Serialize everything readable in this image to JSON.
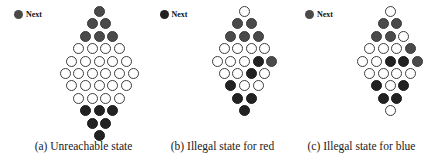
{
  "figure": {
    "background_color": "#ffffff",
    "colors": {
      "red_piece": "#4a4a4a",
      "blue_piece": "#222222",
      "empty_cell": "#ffffff",
      "cell_outline": "#3d3d3d",
      "text": "#1a1a1a"
    }
  },
  "panels": [
    {
      "id": "panel-a",
      "caption": "(a) Unreachable state",
      "legend": {
        "label": "Next",
        "player": "red",
        "color": "#4a4a4a"
      },
      "board": {
        "row_sizes": [
          1,
          2,
          3,
          4,
          5,
          6,
          5,
          4,
          3,
          2,
          1
        ],
        "rows": [
          [
            "red"
          ],
          [
            "red",
            "red"
          ],
          [
            "red",
            "red",
            "red"
          ],
          [
            "empty",
            "empty",
            "empty",
            "empty"
          ],
          [
            "empty",
            "empty",
            "empty",
            "empty",
            "empty"
          ],
          [
            "empty",
            "empty",
            "empty",
            "empty",
            "empty",
            "empty"
          ],
          [
            "empty",
            "empty",
            "empty",
            "empty",
            "empty"
          ],
          [
            "empty",
            "empty",
            "empty",
            "empty"
          ],
          [
            "blue",
            "blue",
            "blue"
          ],
          [
            "blue",
            "blue"
          ],
          [
            "blue"
          ]
        ]
      }
    },
    {
      "id": "panel-b",
      "caption": "(b) Illegal state for red",
      "legend": {
        "label": "Next",
        "player": "blue",
        "color": "#222222"
      },
      "board": {
        "row_sizes": [
          1,
          2,
          3,
          4,
          5,
          4,
          3,
          2,
          1
        ],
        "rows": [
          [
            "empty"
          ],
          [
            "red",
            "red"
          ],
          [
            "red",
            "red",
            "red"
          ],
          [
            "empty",
            "empty",
            "empty",
            "empty"
          ],
          [
            "empty",
            "empty",
            "empty",
            "blue",
            "red"
          ],
          [
            "empty",
            "empty",
            "blue",
            "empty"
          ],
          [
            "blue",
            "empty",
            "empty"
          ],
          [
            "blue",
            "blue"
          ],
          [
            "blue"
          ]
        ]
      }
    },
    {
      "id": "panel-c",
      "caption": "(c) Illegal state for blue",
      "legend": {
        "label": "Next",
        "player": "red",
        "color": "#4a4a4a"
      },
      "board": {
        "row_sizes": [
          1,
          2,
          3,
          4,
          5,
          4,
          3,
          2,
          1
        ],
        "rows": [
          [
            "empty"
          ],
          [
            "red",
            "red"
          ],
          [
            "red",
            "red",
            "empty"
          ],
          [
            "empty",
            "empty",
            "empty",
            "red"
          ],
          [
            "empty",
            "empty",
            "blue",
            "blue",
            "red"
          ],
          [
            "empty",
            "empty",
            "empty",
            "empty"
          ],
          [
            "blue",
            "empty",
            "blue"
          ],
          [
            "blue",
            "blue"
          ],
          [
            "empty"
          ]
        ]
      }
    }
  ]
}
